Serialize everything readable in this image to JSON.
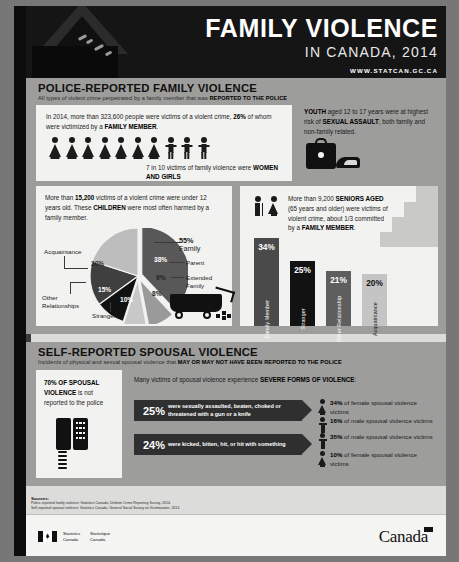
{
  "header": {
    "title": "FAMILY VIOLENCE",
    "subtitle": "IN CANADA, 2014",
    "url": "WWW.STATCAN.GC.CA"
  },
  "section1": {
    "title": "POLICE-REPORTED FAMILY VIOLENCE",
    "sub_plain": "All types of violent crime perpetrated by a family member that was ",
    "sub_bold": "REPORTED TO THE POLICE",
    "intro": {
      "t1": "In 2014, more than 323,600 people were victims of a violent crime, ",
      "b1": "26%",
      "t2": " of whom were victimized by a ",
      "b2": "FAMILY MEMBER",
      "t3": "."
    },
    "pictogram": {
      "female_count": 7,
      "male_count": 3,
      "caption_plain": "7 in 10 victims of family violence were ",
      "caption_bold": "WOMEN AND GIRLS"
    },
    "youth": {
      "b1": "YOUTH",
      "t1": " aged 12 to 17 years were at highest risk of ",
      "b2": "SEXUAL ASSAULT",
      "t2": ", both family and non-family related."
    },
    "children": {
      "t1": "More than ",
      "b1": "15,200",
      "t2": " victims of a violent crime were under 12 years old. These ",
      "b2": "CHILDREN",
      "t3": " were most often harmed by a family member."
    },
    "seniors": {
      "t1": "More than 9,200 ",
      "b1": "SENIORS AGED",
      "t2": " (65 years and older) were victims of violent crime, about 1/3 committed by a ",
      "b2": "FAMILY MEMBER",
      "t3": "."
    }
  },
  "section2": {
    "title": "SELF-REPORTED SPOUSAL VIOLENCE",
    "sub_plain": "Incidents of physical and sexual spousal violence that ",
    "sub_bold": "MAY OR MAY NOT HAVE BEEN REPORTED TO THE POLICE",
    "unreported": {
      "b1": "70% OF SPOUSAL VIOLENCE",
      "t1": " is not reported to the police"
    },
    "severe_intro_plain": "Many victims of spousal violence experience ",
    "severe_intro_bold": "SEVERE FORMS OF VIOLENCE",
    "severe_intro_end": ":",
    "severe": [
      {
        "pct": "25%",
        "desc": "were sexually assaulted, beaten, choked or threatened with a gun or a knife",
        "stats": [
          {
            "pct": "34%",
            "text": " of female spousal violence victims",
            "sex": "female"
          },
          {
            "pct": "16%",
            "text": " of male spousal violence victims",
            "sex": "male"
          }
        ]
      },
      {
        "pct": "24%",
        "desc": "were kicked, bitten, hit, or hit with something",
        "stats": [
          {
            "pct": "35%",
            "text": " of male spousal violence victims",
            "sex": "male"
          },
          {
            "pct": "10%",
            "text": " of female spousal violence victims",
            "sex": "female"
          }
        ]
      }
    ]
  },
  "sources": {
    "label": "Sources:",
    "line1": "Police-reported family violence: Statistics Canada, Uniform Crime Reporting Survey, 2014.",
    "line2": "Self-reported spousal violence: Statistics Canada, General Social Survey on Victimization, 2014."
  },
  "footer": {
    "dept_en": "Statistics\nCanada",
    "dept_fr": "Statistique\nCanada",
    "wordmark": "Canada"
  },
  "chart_data": [
    {
      "type": "pie",
      "title": "Accused-victim relationship for child victims of violent crime (under 12 years)",
      "categories": [
        "Parent",
        "Extended Family",
        "Sibling",
        "Stranger",
        "Other Relationships",
        "Acquaintance"
      ],
      "values": [
        38,
        9,
        8,
        10,
        15,
        20
      ],
      "group_label_pct": "55%",
      "group_label_name": "Family",
      "group_members": [
        "Parent",
        "Extended Family",
        "Sibling"
      ],
      "labels": [
        "38%",
        "9%",
        "8%",
        "10%",
        "15%",
        "20%"
      ],
      "legend_position": "callout-lines",
      "colors": [
        "#585858",
        "#9a9a9a",
        "#c8c8c8",
        "#111111",
        "#3f3f3f",
        "#bdbdbd"
      ]
    },
    {
      "type": "bar",
      "title": "Accused-victim relationship for senior victims of violent crime (65+)",
      "categories": [
        "Family Member",
        "Stranger",
        "Other Relationship",
        "Acquaintance"
      ],
      "values": [
        34,
        25,
        21,
        20
      ],
      "labels": [
        "34%",
        "25%",
        "21%",
        "20%"
      ],
      "ylim": [
        0,
        40
      ],
      "grid": false,
      "colors": [
        "#4a4a4a",
        "#121212",
        "#5e5e5e",
        "#c4c4c4"
      ],
      "label_colors": [
        "#ffffff",
        "#ffffff",
        "#ffffff",
        "#111111"
      ]
    }
  ]
}
